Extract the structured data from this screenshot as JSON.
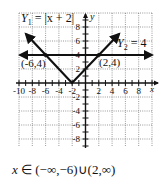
{
  "chart_data": {
    "type": "line",
    "title": "",
    "xlabel": "x",
    "ylabel": "y",
    "xlim": [
      -10,
      10
    ],
    "ylim": [
      -9,
      9
    ],
    "grid": true,
    "x_tick_labels": [
      "-10",
      "-8",
      "-6",
      "-4",
      "-2",
      "2",
      "4",
      "6",
      "8"
    ],
    "y_tick_labels": [
      "8",
      "6",
      "4",
      "2",
      "-2",
      "-4",
      "-6",
      "-8"
    ],
    "series": [
      {
        "name": "Y1 = |x + 2|",
        "label_text": "Y",
        "label_sub": "1",
        "label_rest": " = |x + 2|",
        "points": [
          [
            -9,
            7
          ],
          [
            -2,
            0
          ],
          [
            5,
            7
          ]
        ],
        "arrows": "both"
      },
      {
        "name": "Y2 = 4",
        "label_text": "Y",
        "label_sub": "2",
        "label_rest": " = 4",
        "points": [
          [
            -9.5,
            4
          ],
          [
            10,
            4
          ]
        ],
        "arrows": "both"
      }
    ],
    "annotations": [
      {
        "text": "(-6,4)",
        "x": -6,
        "y": 4
      },
      {
        "text": "(2,4)",
        "x": 2,
        "y": 4
      }
    ]
  },
  "answer": {
    "var": "x",
    "text": " ∈ (−∞,−6)∪(2,∞)"
  },
  "axis": {
    "x_label": "x",
    "y_label": "y"
  }
}
